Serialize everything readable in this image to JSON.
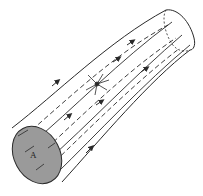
{
  "diagram": {
    "cross_section_label": "A",
    "colors": {
      "stroke": "#2a2a2a",
      "cross_section_fill": "#9a9a9a",
      "background": "#ffffff"
    },
    "elements": [
      {
        "type": "tube",
        "shape": "curved cylinder",
        "direction": "lower-left to upper-right"
      },
      {
        "type": "cross-section",
        "label": "A",
        "shaded": true
      },
      {
        "type": "field-lines",
        "style": "solid",
        "location": "tube surface",
        "arrows": true
      },
      {
        "type": "field-lines",
        "style": "dashed",
        "location": "tube interior",
        "arrows": true
      },
      {
        "type": "point",
        "style": "star burst",
        "location": "tube center"
      }
    ]
  }
}
